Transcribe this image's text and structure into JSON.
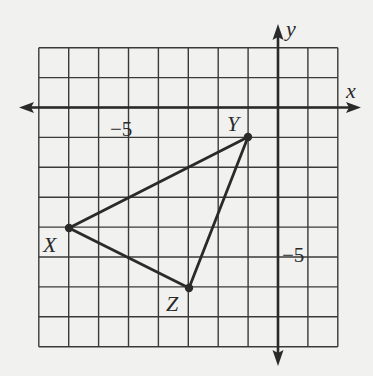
{
  "diagram": {
    "type": "coordinate-plane-triangle",
    "grid": {
      "x_min": -8,
      "x_max": 2,
      "y_min": -8,
      "y_max": 2,
      "step": 1
    },
    "axes": {
      "x_label": "x",
      "y_label": "y"
    },
    "tick_labels": {
      "x": "−5",
      "y": "−5"
    },
    "vertices": [
      {
        "name": "X",
        "x": -7,
        "y": -4
      },
      {
        "name": "Y",
        "x": -1,
        "y": -1
      },
      {
        "name": "Z",
        "x": -3,
        "y": -6
      }
    ],
    "segments": [
      [
        "X",
        "Y"
      ],
      [
        "Y",
        "Z"
      ],
      [
        "Z",
        "X"
      ]
    ],
    "colors": {
      "line": "#2a2a2a",
      "grid": "#3a3a3a",
      "background": "#f1f1f0"
    }
  }
}
